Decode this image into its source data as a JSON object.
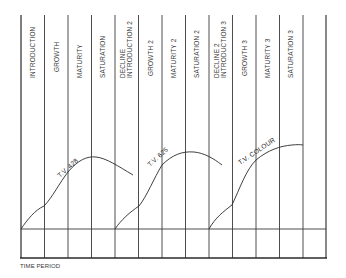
{
  "diagram": {
    "type": "product-life-cycle",
    "x_axis_title": "TIME PERIOD",
    "stages": [
      {
        "label": "INTRODUCTION"
      },
      {
        "label": "GROWTH"
      },
      {
        "label": "MATURITY"
      },
      {
        "label": "SATURATION"
      },
      {
        "label": "DECLINE",
        "label2": "INTRODUCTION 2"
      },
      {
        "label": "GROWTH 2"
      },
      {
        "label": "MATURITY 2"
      },
      {
        "label": "SATURATION 2"
      },
      {
        "label": "DECLINE 2",
        "label2": "INTRODUCTION 3"
      },
      {
        "label": "GROWTH 3"
      },
      {
        "label": "MATURITY 3"
      },
      {
        "label": "SATURATION 3"
      },
      {
        "label": ""
      }
    ],
    "curves": [
      {
        "label": "T.V. 428",
        "start_stage": 0
      },
      {
        "label": "T.V. 625",
        "start_stage": 4
      },
      {
        "label": "T.V. COLOUR",
        "start_stage": 8
      }
    ],
    "colors": {
      "line": "#2a2a2a",
      "grid": "#3a3a3a",
      "background": "#ffffff"
    }
  }
}
